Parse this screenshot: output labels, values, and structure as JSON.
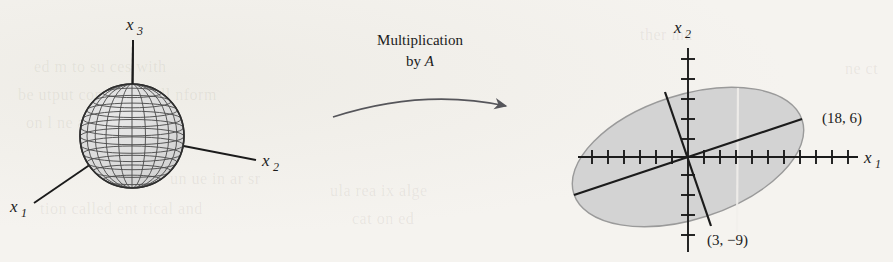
{
  "figure": {
    "kind": "textbook-figure",
    "background_color": "#f4f2ee",
    "ink_color": "#1b1b1b"
  },
  "left_panel": {
    "name": "unit-sphere-3d",
    "shape": "sphere",
    "description": "wireframe shaded unit sphere with three coordinate axes",
    "fill_color": "#dcdcdc",
    "wire_color": "#4a4a4a",
    "center_x": 132,
    "center_y": 136,
    "radius": 52,
    "meridian_count": 12,
    "parallel_count": 11,
    "axes": [
      {
        "id": "x1",
        "base": "x",
        "sub": "1",
        "label": "x₁",
        "direction": "lower-left",
        "tip_x": 32,
        "tip_y": 205
      },
      {
        "id": "x2",
        "base": "x",
        "sub": "2",
        "label": "x₂",
        "direction": "right",
        "tip_x": 258,
        "tip_y": 160
      },
      {
        "id": "x3",
        "base": "x",
        "sub": "3",
        "label": "x₃",
        "direction": "up",
        "tip_x": 133,
        "tip_y": 38
      }
    ]
  },
  "transform_arrow": {
    "name": "multiplication-arrow",
    "line1": "Multiplication",
    "line2_prefix": "by ",
    "line2_matrix": "A",
    "full_text": "Multiplication by A",
    "color": "#55555a",
    "start_x": 333,
    "start_y": 116,
    "end_x": 512,
    "end_y": 108
  },
  "right_panel": {
    "name": "image-ellipse-plot",
    "ellipse_fill": "#d3d3d3",
    "ellipse_stroke": "#9a9a9a",
    "origin_x": 688,
    "origin_y": 157,
    "tick_spacing": 16,
    "x_axis": {
      "label_base": "x",
      "label_sub": "1",
      "label": "x₁",
      "left_end_x": 578,
      "right_end_x": 858,
      "ticks_left": 7,
      "ticks_right": 10
    },
    "y_axis": {
      "label_base": "x",
      "label_sub": "2",
      "label": "x₂",
      "top_end_y": 48,
      "bottom_end_y": 252,
      "ticks_up": 5,
      "ticks_down": 6
    },
    "ellipse": {
      "rx": 120,
      "ry": 62,
      "rotation_deg": -18
    },
    "axis_segments": [
      {
        "name": "major-axis-segment",
        "from": [
          -18,
          -6
        ],
        "to": [
          18,
          6
        ],
        "endpoint_label": "(18, 6)"
      },
      {
        "name": "minor-axis-segment",
        "from": [
          -3,
          9
        ],
        "to": [
          3,
          -9
        ],
        "endpoint_label": "(3, −9)"
      }
    ],
    "point_labels": [
      {
        "name": "point-label-18-6",
        "text": "(18, 6)",
        "x": 822,
        "y": 119
      },
      {
        "name": "point-label-3-neg9",
        "text": "(3, −9)",
        "x": 705,
        "y": 243
      }
    ]
  },
  "bleed_through": [
    {
      "text": "ed  m  to  su  ces  with",
      "x": 34,
      "y": 58,
      "size": 16
    },
    {
      "text": "be  utput  consi  ered  all  nform",
      "x": 18,
      "y": 86,
      "size": 16
    },
    {
      "text": "on  l  ne  a  rel  ted  ion",
      "x": 26,
      "y": 114,
      "size": 16
    },
    {
      "text": "un  ue  in  ar  sr",
      "x": 170,
      "y": 170,
      "size": 16
    },
    {
      "text": "tion  called  ent  rical  and",
      "x": 40,
      "y": 200,
      "size": 16
    },
    {
      "text": "ula  rea  ix  alge",
      "x": 330,
      "y": 182,
      "size": 16
    },
    {
      "text": "cat  on  ed",
      "x": 352,
      "y": 210,
      "size": 16
    },
    {
      "text": "ther  mu",
      "x": 640,
      "y": 26,
      "size": 16
    },
    {
      "text": "ne  ct",
      "x": 845,
      "y": 60,
      "size": 16
    }
  ]
}
